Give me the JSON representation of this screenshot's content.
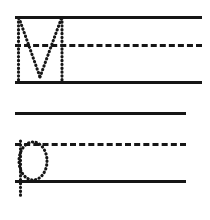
{
  "worksheet": {
    "title": "Handwriting Practice Worksheet",
    "background_color": "#ffffff",
    "ink_color": "#161616",
    "width": 210,
    "height": 220
  },
  "line_groups": [
    {
      "name": "upper-practice-row",
      "left": 15,
      "right": 202,
      "top_line_y": 16,
      "mid_line_y": 44,
      "base_line_y": 81,
      "top_line_style": "solid",
      "mid_line_style": "dashed",
      "base_line_style": "solid",
      "letter": {
        "character": "M",
        "case": "uppercase",
        "style": "dotted-trace",
        "stem_left_x": 18,
        "stem_right_x": 62,
        "apex_y": 18,
        "valley_x": 40,
        "valley_y": 76,
        "baseline_y": 81
      }
    },
    {
      "name": "lower-practice-row",
      "left": 15,
      "right": 186,
      "top_line_y": 112,
      "mid_line_y": 143,
      "base_line_y": 180,
      "top_line_style": "solid",
      "mid_line_style": "dashed",
      "base_line_style": "solid",
      "letter": {
        "character": "p",
        "case": "lowercase",
        "style": "dotted-trace",
        "stem_x": 20,
        "stem_top_y": 141,
        "descender_bottom_y": 198,
        "bowl_center_x": 33,
        "bowl_center_y": 161,
        "bowl_radius_x": 14,
        "bowl_radius_y": 19
      }
    }
  ]
}
